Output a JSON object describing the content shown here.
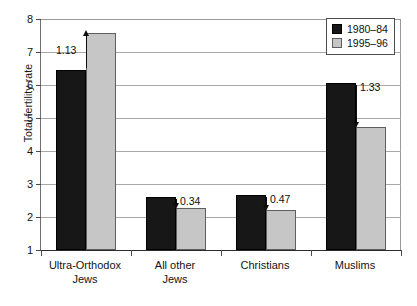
{
  "chart_data": {
    "type": "bar",
    "title": "",
    "subtitle": "",
    "xlabel": "",
    "ylabel": "Total fertility rate",
    "categories": [
      "Ultra-Orthodox\nJews",
      "All other\nJews",
      "Christians",
      "Muslims"
    ],
    "category_labels_flat": [
      "Ultra-Orthodox Jews",
      "All other Jews",
      "Christians",
      "Muslims"
    ],
    "series": [
      {
        "name": "1980–84",
        "color": "#171717",
        "values": [
          6.45,
          2.6,
          2.67,
          6.05
        ]
      },
      {
        "name": "1995–96",
        "color": "#c6c6c6",
        "values": [
          7.58,
          2.26,
          2.2,
          4.72
        ]
      }
    ],
    "ylim": [
      1,
      8
    ],
    "yticks": [
      1,
      2,
      3,
      4,
      5,
      6,
      7,
      8
    ],
    "ytick_labels": [
      "1",
      "2",
      "3",
      "4",
      "5",
      "6",
      "7",
      "8"
    ],
    "grid": true,
    "grid_axis": "y",
    "legend_position": "top-right",
    "annotations": [
      {
        "label": "1.13",
        "category": "Ultra-Orthodox Jews",
        "value": 1.13,
        "direction": "up"
      },
      {
        "label": "0.34",
        "category": "All other Jews",
        "value": 0.34,
        "direction": "down"
      },
      {
        "label": "0.47",
        "category": "Christians",
        "value": 0.47,
        "direction": "down"
      },
      {
        "label": "1.33",
        "category": "Muslims",
        "value": 1.33,
        "direction": "down"
      }
    ],
    "annotation_note": "Each label is the change in total fertility rate from 1980–84 to 1995–96"
  },
  "legend": {
    "entries": [
      {
        "label": "1980–84",
        "swatch": "#171717"
      },
      {
        "label": "1995–96",
        "swatch": "#c6c6c6"
      }
    ]
  },
  "axes": {
    "y_title": "Total fertility rate",
    "y_tick_labels": [
      "8",
      "7",
      "6",
      "5",
      "4",
      "3",
      "2",
      "1"
    ],
    "x_tick_labels": [
      "Ultra-Orthodox\nJews",
      "All other\nJews",
      "Christians",
      "Muslims"
    ]
  },
  "colors": {
    "series_1980_84": "#171717",
    "series_1995_96": "#c6c6c6",
    "gridline": "#a8a8a8",
    "axis": "#2b2b2b",
    "text": "#131313",
    "background": "#ffffff"
  }
}
